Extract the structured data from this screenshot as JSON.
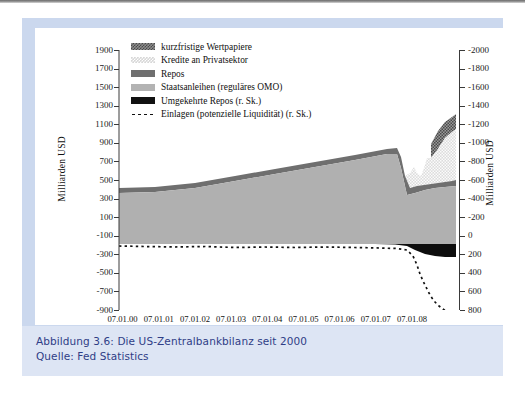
{
  "caption": {
    "line1": "Abbildung 3.6:  Die US-Zentralbankbilanz seit 2000",
    "line2": "Quelle: Fed Statistics"
  },
  "colors": {
    "frame": "#cbd8ee",
    "caption_bg": "#dde5f4",
    "caption_text": "#2f3d86",
    "staatsanleihen": "#b3b3b3",
    "repos": "#6f6f6f",
    "kredite": "#d7d7d7",
    "kurzfristige": "#8d8d8d",
    "umgekehrte_repos": "#111111",
    "einlagen": "#111111"
  },
  "chart_data": {
    "type": "area",
    "title": "",
    "subtitle": "",
    "xlabel": "",
    "ylabel": "Milliarden USD",
    "ylabel_right": "Milliarden USD",
    "grid": false,
    "legend_position": "top-left",
    "ylim": [
      -900,
      1900
    ],
    "yticks": [
      1900,
      1700,
      1500,
      1300,
      1100,
      900,
      700,
      500,
      300,
      100,
      -100,
      -300,
      -500,
      -700,
      -900
    ],
    "ytick_labels": [
      "1900",
      "1700",
      "1500",
      "1300",
      "1100",
      "900",
      "700",
      "500",
      "300",
      "100",
      "-100",
      "-300",
      "-500",
      "-700",
      "-900"
    ],
    "ylim_right": [
      800,
      -2000
    ],
    "yticks_right": [
      -2000,
      -1800,
      -1600,
      -1400,
      -1200,
      -1000,
      -800,
      -600,
      -400,
      -200,
      0,
      200,
      400,
      600,
      800
    ],
    "ytick_labels_right": [
      "-2000",
      "-1800",
      "-1600",
      "-1400",
      "-1200",
      "-1000",
      "-800",
      "-600",
      "-400",
      "-200",
      "0",
      "200",
      "400",
      "600",
      "800"
    ],
    "xticks": [
      "07.01.00",
      "07.01.01",
      "07.01.02",
      "07.01.03",
      "07.01.04",
      "07.01.05",
      "07.01.06",
      "07.01.07",
      "07.01.08"
    ],
    "xlim": [
      "07.01.00",
      "2009 H1"
    ],
    "legend": [
      {
        "label": "kurzfristige Wertpapiere",
        "swatch": "checker-dark"
      },
      {
        "label": "Kredite an Privatsektor",
        "swatch": "checker-light"
      },
      {
        "label": "Repos",
        "swatch": "solid-darkgray"
      },
      {
        "label": "Staatsanleihen (reguläres OMO)",
        "swatch": "solid-gray"
      },
      {
        "label": "Umgekehrte Repos (r. Sk.)",
        "swatch": "solid-black"
      },
      {
        "label": "Einlagen (potenzielle Liquidität) (r. Sk.)",
        "swatch": "dotted-line"
      }
    ],
    "series": [
      {
        "name": "Staatsanleihen (reguläres OMO)",
        "axis": "left",
        "x": [
          0,
          0.06,
          0.14,
          0.25,
          0.36,
          0.5,
          0.62,
          0.75,
          0.88,
          1.0,
          1.12,
          1.25,
          1.38,
          1.5,
          1.62,
          1.75,
          1.88,
          2.0,
          2.12,
          2.25,
          2.38,
          2.5,
          2.62,
          2.75,
          2.88,
          3.0,
          3.12,
          3.25,
          3.38,
          3.5,
          3.62,
          3.75,
          3.88,
          4.0,
          4.25,
          4.5,
          4.75,
          5.0,
          5.25,
          5.5,
          5.75,
          6.0,
          6.25,
          6.5,
          6.75,
          7.0,
          7.25,
          7.5,
          7.75,
          8.0,
          8.1,
          8.2,
          8.3,
          8.4,
          8.5,
          8.6,
          8.7,
          8.8,
          8.9,
          9.0,
          9.1,
          9.2,
          9.3,
          9.4
        ],
        "values": [
          520,
          520,
          528,
          524,
          522,
          524,
          530,
          528,
          534,
          534,
          540,
          548,
          556,
          560,
          566,
          574,
          580,
          590,
          600,
          612,
          618,
          624,
          630,
          640,
          648,
          652,
          660,
          666,
          672,
          676,
          684,
          690,
          696,
          700,
          708,
          716,
          724,
          732,
          740,
          748,
          756,
          764,
          772,
          780,
          788,
          794,
          800,
          808,
          814,
          818,
          812,
          800,
          700,
          560,
          500,
          488,
          484,
          486,
          490,
          494,
          498,
          502,
          506,
          510
        ]
      },
      {
        "name": "Repos",
        "axis": "left",
        "note": "thin band stacked on top of Staatsanleihen, ~10-30 Mrd; widens to ~70 Mrd late 2008",
        "x": [
          0,
          1,
          2,
          3,
          4,
          5,
          6,
          7,
          8,
          8.3,
          8.5,
          8.7,
          9.0,
          9.4
        ],
        "values": [
          12,
          14,
          16,
          18,
          18,
          20,
          20,
          22,
          24,
          40,
          60,
          70,
          60,
          55
        ]
      },
      {
        "name": "Kredite an Privatsektor",
        "axis": "left",
        "note": "near zero until late 2008, then explodes",
        "x": [
          0,
          6,
          7,
          8.0,
          8.2,
          8.4,
          8.5,
          8.6,
          8.7,
          8.8,
          8.9,
          9.0,
          9.1,
          9.2,
          9.3,
          9.4
        ],
        "values": [
          0,
          0,
          0,
          10,
          40,
          180,
          300,
          260,
          240,
          330,
          560,
          700,
          790,
          820,
          840,
          860
        ]
      },
      {
        "name": "kurzfristige Wertpapiere",
        "axis": "left",
        "note": "top checkered layer appears only at the very end",
        "x": [
          0,
          8.6,
          8.8,
          9.0,
          9.1,
          9.2,
          9.3,
          9.4
        ],
        "values": [
          0,
          0,
          20,
          90,
          140,
          180,
          200,
          210
        ]
      },
      {
        "name": "Umgekehrte Repos (r. Sk.)",
        "axis": "right",
        "note": "black band just below zero; grows at the very end",
        "x": [
          0,
          7.5,
          8.0,
          8.4,
          8.6,
          8.8,
          9.0,
          9.2,
          9.4
        ],
        "values": [
          8,
          10,
          14,
          30,
          70,
          95,
          100,
          105,
          105
        ]
      },
      {
        "name": "Einlagen (potenzielle Liquidität) (r. Sk.)",
        "axis": "right",
        "style": "dotted",
        "x": [
          0,
          0.5,
          1.0,
          1.5,
          2.0,
          2.5,
          3.0,
          3.5,
          4.0,
          4.5,
          5.0,
          5.5,
          6.0,
          6.5,
          7.0,
          7.5,
          8.0,
          8.2,
          8.4,
          8.5,
          8.6,
          8.7,
          8.8,
          8.9,
          9.0,
          9.1,
          9.2,
          9.3,
          9.4
        ],
        "values": [
          18,
          20,
          22,
          24,
          22,
          26,
          24,
          22,
          24,
          26,
          24,
          22,
          26,
          24,
          26,
          28,
          34,
          60,
          120,
          200,
          260,
          330,
          400,
          470,
          560,
          640,
          700,
          760,
          800
        ]
      }
    ]
  }
}
